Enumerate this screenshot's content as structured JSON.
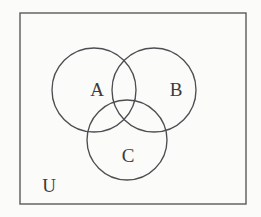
{
  "figure": {
    "kind": "venn-diagram",
    "background_color": "#fbfbf9",
    "stroke_color": "#4e4e52",
    "border_color": "#5a5a5a",
    "label_color": "#3c3c3c"
  },
  "universe": {
    "label": "U",
    "label_x": 49,
    "label_y": 192,
    "rect": {
      "x": 20,
      "y": 13,
      "width": 226,
      "height": 191
    }
  },
  "sets": [
    {
      "id": "set-a",
      "label": "A",
      "cx": 94,
      "cy": 90,
      "r": 42,
      "label_x": 97,
      "label_y": 96
    },
    {
      "id": "set-b",
      "label": "B",
      "cx": 154,
      "cy": 90,
      "r": 42,
      "label_x": 176,
      "label_y": 96
    },
    {
      "id": "set-c",
      "label": "C",
      "cx": 127,
      "cy": 140,
      "r": 40,
      "label_x": 128,
      "label_y": 162
    }
  ]
}
